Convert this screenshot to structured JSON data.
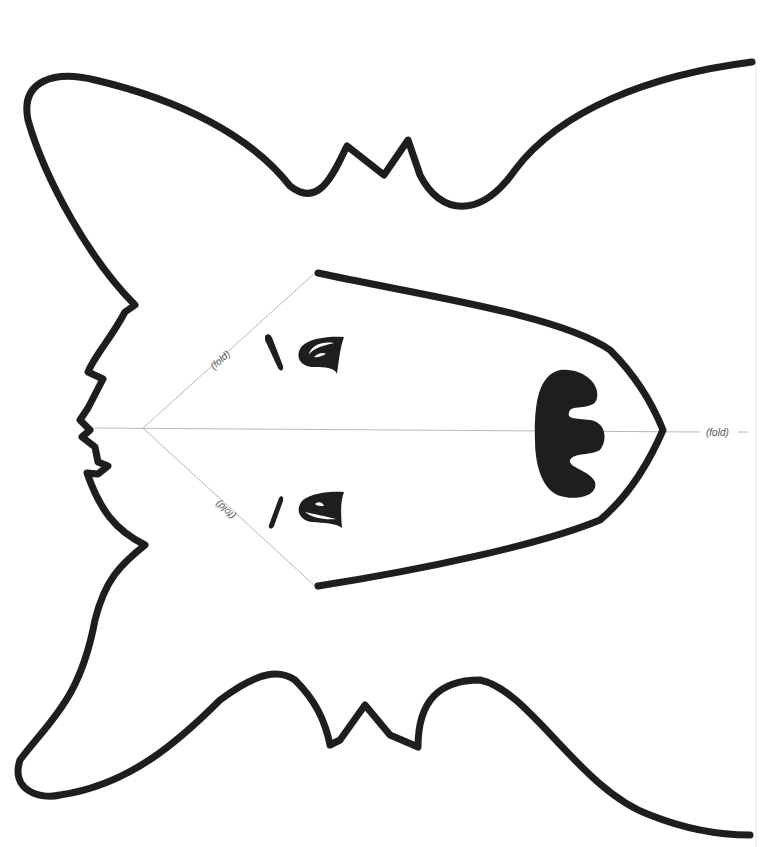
{
  "template": {
    "subject": "dog mask cutout template",
    "fold_labels": {
      "upper_diagonal": "(fold)",
      "lower_diagonal": "(fold)",
      "center": "(fold)"
    },
    "colors": {
      "ink": "#1e1e1e",
      "fold_line": "#b8b8b8",
      "background": "#ffffff"
    }
  }
}
